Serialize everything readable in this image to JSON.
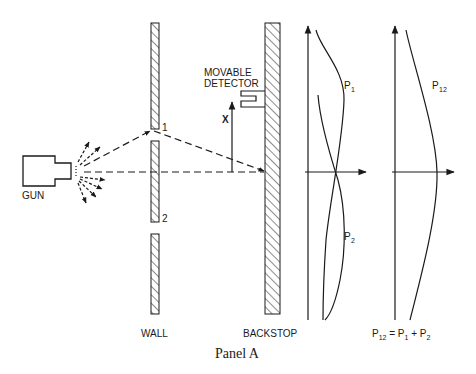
{
  "diagram": {
    "caption": "Panel A",
    "colors": {
      "ink": "#1a1a1a",
      "background": "#ffffff"
    },
    "labels": {
      "gun": "GUN",
      "wall": "WALL",
      "backstop": "BACKSTOP",
      "detector_line1": "MOVABLE",
      "detector_line2": "DETECTOR",
      "x_axis": "X",
      "slit1": "1",
      "slit2": "2",
      "p1": "P",
      "p1_sub": "1",
      "p2": "P",
      "p2_sub": "2",
      "p12": "P",
      "p12_sub": "12",
      "eq_p": "P",
      "eq_p12_sub": "12",
      "eq_equals_p": " = P",
      "eq_p1_sub": "1",
      "eq_plus_p": " + P",
      "eq_p2_sub": "2"
    },
    "components": [
      {
        "id": "gun",
        "description": "Electron gun emitting particles (dashed arrows)"
      },
      {
        "id": "wall",
        "description": "Hatched wall with two slits labeled 1 and 2"
      },
      {
        "id": "backstop",
        "description": "Hatched backstop with movable detector"
      },
      {
        "id": "graph-individual",
        "description": "Probability curves P1 and P2"
      },
      {
        "id": "graph-combined",
        "description": "Combined probability P12 = P1 + P2"
      }
    ]
  }
}
